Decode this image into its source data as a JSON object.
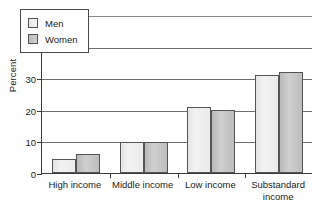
{
  "chart_data": {
    "type": "bar",
    "title": "",
    "xlabel": "",
    "ylabel": "Percent",
    "ylim": [
      0,
      50
    ],
    "yticks": [
      0,
      10,
      20,
      30,
      40,
      50
    ],
    "ytick_labels": [
      "0",
      "10",
      "20",
      "30",
      "40",
      "50"
    ],
    "grid": true,
    "legend_position": "upper left (inside plot area)",
    "categories": [
      "High income",
      "Middle income",
      "Low income",
      "Substandard income"
    ],
    "category_label_lines": [
      [
        "High income"
      ],
      [
        "Middle income"
      ],
      [
        "Low income"
      ],
      [
        "Substandard",
        "income"
      ]
    ],
    "series": [
      {
        "name": "Men",
        "color": "#eeeeee",
        "values": [
          4.3,
          9.8,
          21.0,
          31.0
        ]
      },
      {
        "name": "Women",
        "color": "#c4c4c4",
        "values": [
          6.0,
          9.8,
          19.8,
          32.0
        ]
      }
    ]
  },
  "legend": {
    "entries": [
      {
        "label": "Men"
      },
      {
        "label": "Women"
      }
    ]
  }
}
